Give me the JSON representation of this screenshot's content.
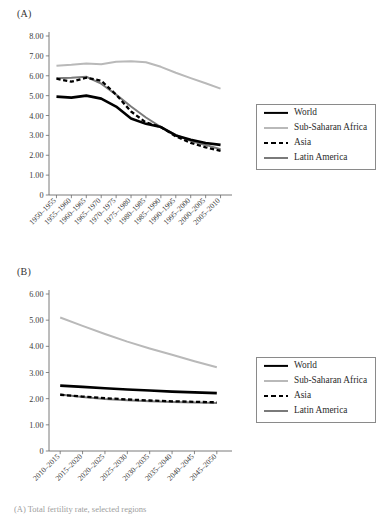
{
  "figure": {
    "caption": "(A) Total fertility rate, selected regions"
  },
  "panels": [
    {
      "id": "A",
      "label": "(A)",
      "legend": {
        "items": [
          {
            "name": "World",
            "style": "solid",
            "color": "#000000",
            "width": 2.6
          },
          {
            "name": "Sub-Saharan Africa",
            "style": "solid",
            "color": "#b9b9b9",
            "width": 2.0
          },
          {
            "name": "Asia",
            "style": "dashed",
            "color": "#000000",
            "width": 2.3
          },
          {
            "name": "Latin America",
            "style": "solid",
            "color": "#7a7a7a",
            "width": 2.0
          }
        ]
      }
    },
    {
      "id": "B",
      "label": "(B)",
      "legend": {
        "items": [
          {
            "name": "World",
            "style": "solid",
            "color": "#000000",
            "width": 2.6
          },
          {
            "name": "Sub-Saharan Africa",
            "style": "solid",
            "color": "#b9b9b9",
            "width": 2.0
          },
          {
            "name": "Asia",
            "style": "dashed",
            "color": "#000000",
            "width": 2.3
          },
          {
            "name": "Latin America",
            "style": "solid",
            "color": "#7a7a7a",
            "width": 2.0
          }
        ]
      }
    }
  ],
  "chart_data": [
    {
      "type": "line",
      "panel": "A",
      "title": "(A)",
      "xlabel": "",
      "ylabel": "",
      "ylim": [
        0,
        8
      ],
      "yticks": [
        0,
        1,
        2,
        3,
        4,
        5,
        6,
        7,
        8
      ],
      "ytick_labels": [
        "0",
        "1.00",
        "2.00",
        "3.00",
        "4.00",
        "5.00",
        "6.00",
        "7.00",
        "8.00"
      ],
      "grid": false,
      "legend_position": "right",
      "categories": [
        "1950–1955",
        "1955–1960",
        "1960–1965",
        "1965–1970",
        "1970–1975",
        "1975–1980",
        "1980–1985",
        "1985–1990",
        "1990–1995",
        "1995–2000",
        "2000–2005",
        "2005–2010"
      ],
      "series": [
        {
          "name": "World",
          "values": [
            4.95,
            4.9,
            5.0,
            4.85,
            4.45,
            3.85,
            3.58,
            3.42,
            3.0,
            2.78,
            2.62,
            2.52
          ]
        },
        {
          "name": "Sub-Saharan Africa",
          "values": [
            6.5,
            6.55,
            6.62,
            6.58,
            6.7,
            6.73,
            6.68,
            6.45,
            6.15,
            5.88,
            5.62,
            5.35
          ]
        },
        {
          "name": "Asia",
          "values": [
            5.85,
            5.7,
            5.9,
            5.75,
            5.05,
            4.2,
            3.65,
            3.42,
            2.95,
            2.62,
            2.4,
            2.22
          ]
        },
        {
          "name": "Latin America",
          "values": [
            5.88,
            5.9,
            5.95,
            5.6,
            5.05,
            4.45,
            3.9,
            3.42,
            3.02,
            2.72,
            2.52,
            2.3
          ]
        }
      ]
    },
    {
      "type": "line",
      "panel": "B",
      "title": "(B)",
      "xlabel": "",
      "ylabel": "",
      "ylim": [
        0,
        6
      ],
      "yticks": [
        0,
        1,
        2,
        3,
        4,
        5,
        6
      ],
      "ytick_labels": [
        "0",
        "1.00",
        "2.00",
        "3.00",
        "4.00",
        "5.00",
        "6.00"
      ],
      "grid": false,
      "legend_position": "right",
      "categories": [
        "2010–2015",
        "2015–2020",
        "2020–2025",
        "2025–2030",
        "2030–2035",
        "2035–2040",
        "2040–2045",
        "2045–2050"
      ],
      "series": [
        {
          "name": "World",
          "values": [
            2.5,
            2.45,
            2.4,
            2.35,
            2.31,
            2.27,
            2.24,
            2.21
          ]
        },
        {
          "name": "Sub-Saharan Africa",
          "values": [
            5.1,
            4.78,
            4.47,
            4.18,
            3.92,
            3.68,
            3.43,
            3.2
          ]
        },
        {
          "name": "Asia",
          "values": [
            2.15,
            2.08,
            2.02,
            1.97,
            1.93,
            1.9,
            1.88,
            1.86
          ]
        },
        {
          "name": "Latin America",
          "values": [
            2.16,
            2.06,
            1.99,
            1.94,
            1.9,
            1.87,
            1.85,
            1.83
          ]
        }
      ]
    }
  ]
}
